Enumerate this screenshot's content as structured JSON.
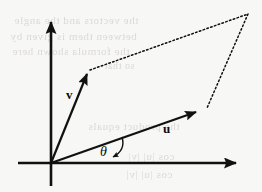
{
  "figure": {
    "background_color": "#f7f7f5",
    "ink_color": "#111111",
    "ghost_color": "#d8d4d2",
    "width": 262,
    "height": 192
  },
  "axes": {
    "x_axis": {
      "name": "horizontal-axis",
      "from_x": 18,
      "from_y": 163,
      "to_x": 247,
      "to_y": 163,
      "arrow": "right"
    },
    "y_axis": {
      "name": "vertical-axis",
      "from_x": 51,
      "from_y": 186,
      "to_x": 51,
      "to_y": 11,
      "arrow": "up"
    },
    "origin": {
      "x": 51,
      "y": 163
    }
  },
  "vectors": [
    {
      "id": "v",
      "label": "v",
      "label_x": 66,
      "label_y": 88,
      "tail_x": 51,
      "tail_y": 163,
      "head_x": 90,
      "head_y": 70,
      "style": "solid",
      "arrow": true
    },
    {
      "id": "u",
      "label": "u",
      "label_x": 163,
      "label_y": 122,
      "tail_x": 51,
      "tail_y": 163,
      "head_x": 205,
      "head_y": 109,
      "style": "solid",
      "arrow": true
    }
  ],
  "parallelogram": {
    "name": "parallelogram-completion",
    "style": "dotted",
    "sides": [
      {
        "id": "v-to-sum",
        "from_x": 90,
        "from_y": 70,
        "to_x": 248,
        "to_y": 14
      },
      {
        "id": "sum-to-u",
        "from_x": 248,
        "from_y": 14,
        "to_x": 207,
        "to_y": 108
      }
    ],
    "sum_vertex": {
      "x": 248,
      "y": 14
    }
  },
  "angle": {
    "symbol": "θ",
    "label": "θ",
    "label_x": 100,
    "label_y": 145,
    "arc_start_x": 120,
    "arc_start_y": 138,
    "arc_end_x": 113,
    "arc_end_y": 161,
    "arrow": "down",
    "description": "angle between vector u and the positive x-axis"
  },
  "ghost_text": {
    "description": "faint mirrored bleed-through text from reverse side of scanned page",
    "lines": [
      {
        "text": "the vectors and the angle",
        "x": 14,
        "y": 14,
        "size": 11
      },
      {
        "text": "between them is given by",
        "x": 10,
        "y": 30,
        "size": 11
      },
      {
        "text": "the formula shown here",
        "x": 12,
        "y": 45,
        "size": 11
      },
      {
        "text": "so that",
        "x": 104,
        "y": 60,
        "size": 10
      },
      {
        "text": "the product equals",
        "x": 88,
        "y": 120,
        "size": 11
      },
      {
        "text": "cos |u| |v|",
        "x": 128,
        "y": 150,
        "size": 11
      },
      {
        "text": "cos |u| |v|",
        "x": 126,
        "y": 168,
        "size": 11
      }
    ]
  }
}
